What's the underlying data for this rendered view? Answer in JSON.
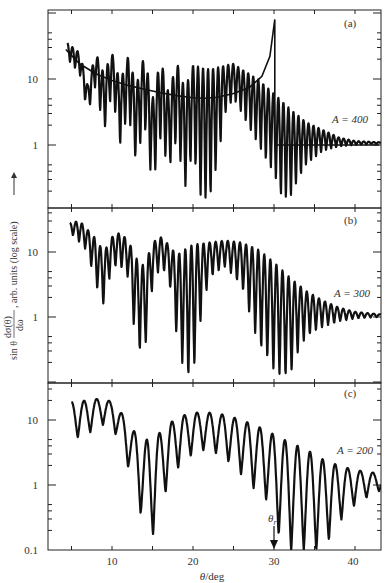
{
  "chart_data": {
    "type": "line",
    "title": "",
    "xlabel": "θ/deg",
    "ylabel": "sin θ dσ(θ)/dω, arb. units (log scale)",
    "xlim": [
      3.5,
      43
    ],
    "x_ticks": [
      5,
      10,
      15,
      20,
      25,
      30,
      35,
      40
    ],
    "x_tick_labels": [
      "10",
      "20",
      "30",
      "40"
    ],
    "y_scale": "log",
    "panels": [
      {
        "id": "a",
        "label": "(a)",
        "series_label": "A = 400",
        "ylim": [
          0.12,
          80
        ],
        "y_tick_labels": [
          "10",
          "1"
        ],
        "oscillation_period_deg": 0.62,
        "envelope_upper": [
          [
            4.5,
            35
          ],
          [
            6,
            25
          ],
          [
            7,
            8
          ],
          [
            8,
            25
          ],
          [
            9,
            12
          ],
          [
            10,
            25
          ],
          [
            11,
            9
          ],
          [
            12,
            22
          ],
          [
            13,
            8
          ],
          [
            14,
            23
          ],
          [
            15,
            5
          ],
          [
            16,
            20
          ],
          [
            17,
            6
          ],
          [
            18,
            18
          ],
          [
            19,
            7
          ],
          [
            20,
            16
          ],
          [
            22,
            14
          ],
          [
            24,
            16
          ],
          [
            25,
            17
          ],
          [
            26,
            14
          ],
          [
            28,
            10
          ],
          [
            30,
            6
          ],
          [
            32,
            3.5
          ],
          [
            34,
            2.2
          ],
          [
            36,
            1.7
          ],
          [
            38,
            1.3
          ],
          [
            40,
            1.15
          ],
          [
            43,
            1.1
          ]
        ],
        "envelope_lower": [
          [
            4.5,
            20
          ],
          [
            6,
            12
          ],
          [
            7,
            3
          ],
          [
            8,
            8
          ],
          [
            9,
            1.5
          ],
          [
            10,
            6
          ],
          [
            11,
            1
          ],
          [
            12,
            3
          ],
          [
            13,
            0.5
          ],
          [
            14,
            2
          ],
          [
            15,
            0.22
          ],
          [
            16,
            1.2
          ],
          [
            17,
            0.4
          ],
          [
            18,
            1.2
          ],
          [
            19,
            0.2
          ],
          [
            20,
            0.8
          ],
          [
            21,
            0.14
          ],
          [
            22,
            0.14
          ],
          [
            23,
            0.5
          ],
          [
            24,
            3
          ],
          [
            25,
            5
          ],
          [
            26,
            3
          ],
          [
            28,
            1
          ],
          [
            30,
            0.35
          ],
          [
            31,
            0.15
          ],
          [
            32,
            0.15
          ],
          [
            33,
            0.3
          ],
          [
            34,
            0.5
          ],
          [
            36,
            0.8
          ],
          [
            38,
            0.95
          ],
          [
            40,
            1.0
          ],
          [
            43,
            1.05
          ]
        ],
        "classical_curve": [
          [
            4.3,
            28
          ],
          [
            6,
            17
          ],
          [
            8,
            12
          ],
          [
            10,
            9.5
          ],
          [
            12,
            8
          ],
          [
            14,
            7
          ],
          [
            16,
            6.2
          ],
          [
            18,
            5.6
          ],
          [
            20,
            5.2
          ],
          [
            21.5,
            5.1
          ],
          [
            23,
            5.3
          ],
          [
            25,
            6
          ],
          [
            27,
            7.5
          ],
          [
            28.5,
            11
          ],
          [
            29.5,
            22
          ],
          [
            30.1,
            80
          ]
        ],
        "classical_after_rainbow": [
          [
            30.1,
            1.0
          ],
          [
            43,
            1.0
          ]
        ]
      },
      {
        "id": "b",
        "label": "(b)",
        "series_label": "A = 300",
        "ylim": [
          0.12,
          60
        ],
        "y_tick_labels": [
          "10",
          "1"
        ],
        "oscillation_period_deg": 0.75,
        "envelope_upper": [
          [
            4.8,
            28
          ],
          [
            6,
            30
          ],
          [
            7,
            22
          ],
          [
            8,
            16
          ],
          [
            9,
            10
          ],
          [
            10,
            17
          ],
          [
            11,
            20
          ],
          [
            12,
            15
          ],
          [
            13,
            8
          ],
          [
            14,
            6
          ],
          [
            15,
            14
          ],
          [
            16,
            17
          ],
          [
            17,
            13
          ],
          [
            18,
            9
          ],
          [
            19,
            11
          ],
          [
            20,
            13
          ],
          [
            22,
            14
          ],
          [
            24,
            15
          ],
          [
            26,
            14
          ],
          [
            28,
            11
          ],
          [
            30,
            7
          ],
          [
            32,
            4
          ],
          [
            34,
            2.5
          ],
          [
            36,
            1.8
          ],
          [
            38,
            1.4
          ],
          [
            40,
            1.2
          ],
          [
            43,
            1.1
          ]
        ],
        "envelope_lower": [
          [
            4.8,
            20
          ],
          [
            6,
            14
          ],
          [
            7,
            10
          ],
          [
            8,
            3
          ],
          [
            9,
            1.5
          ],
          [
            10,
            6
          ],
          [
            11,
            6
          ],
          [
            12,
            4
          ],
          [
            13,
            0.35
          ],
          [
            14,
            0.25
          ],
          [
            15,
            3
          ],
          [
            16,
            6
          ],
          [
            17,
            4
          ],
          [
            18,
            0.5
          ],
          [
            19,
            0.12
          ],
          [
            20,
            0.12
          ],
          [
            21,
            1
          ],
          [
            22,
            4
          ],
          [
            24,
            6
          ],
          [
            26,
            3
          ],
          [
            28,
            0.4
          ],
          [
            30,
            0.15
          ],
          [
            31,
            0.12
          ],
          [
            32,
            0.12
          ],
          [
            33,
            0.3
          ],
          [
            34,
            0.5
          ],
          [
            36,
            0.7
          ],
          [
            38,
            0.85
          ],
          [
            40,
            0.95
          ],
          [
            43,
            1.0
          ]
        ]
      },
      {
        "id": "c",
        "label": "(c)",
        "series_label": "A = 200",
        "ylim": [
          0.1,
          40
        ],
        "y_tick_labels": [
          "10",
          "1",
          "0.1"
        ],
        "oscillation_period_deg": 1.55,
        "envelope_upper": [
          [
            5,
            19
          ],
          [
            7,
            20
          ],
          [
            9,
            22
          ],
          [
            10.5,
            17
          ],
          [
            12,
            9
          ],
          [
            13.5,
            5
          ],
          [
            15,
            5
          ],
          [
            16.5,
            7.5
          ],
          [
            18,
            11
          ],
          [
            20,
            13
          ],
          [
            22,
            13
          ],
          [
            24,
            12
          ],
          [
            26,
            10
          ],
          [
            28,
            8
          ],
          [
            30,
            6
          ],
          [
            32,
            4.5
          ],
          [
            34,
            3.5
          ],
          [
            36,
            2.5
          ],
          [
            38,
            2
          ],
          [
            40,
            1.7
          ],
          [
            43,
            1.5
          ]
        ],
        "envelope_lower": [
          [
            5,
            5
          ],
          [
            7,
            6
          ],
          [
            8.5,
            8.5
          ],
          [
            10,
            8
          ],
          [
            11.5,
            3
          ],
          [
            13,
            0.7
          ],
          [
            14.6,
            0.1
          ],
          [
            16,
            0.5
          ],
          [
            17.5,
            1.4
          ],
          [
            19,
            2.5
          ],
          [
            21,
            3.5
          ],
          [
            23,
            3
          ],
          [
            25,
            2
          ],
          [
            27,
            1
          ],
          [
            29,
            0.6
          ],
          [
            30.5,
            0.18
          ],
          [
            32,
            0.1
          ],
          [
            34,
            0.1
          ],
          [
            36,
            0.1
          ],
          [
            37.5,
            0.2
          ],
          [
            39,
            0.4
          ],
          [
            41,
            0.6
          ],
          [
            43,
            0.8
          ]
        ],
        "annotation": {
          "text": "θr",
          "x": 30,
          "arrow": "down"
        }
      }
    ]
  },
  "labels": {
    "panel_a": "(a)",
    "panel_b": "(b)",
    "panel_c": "(c)",
    "series_a": "A = 400",
    "series_b": "A = 300",
    "series_c": "A = 200",
    "xlabel_theta": "θ",
    "xlabel_unit": "/deg",
    "ylabel_prefix": "sin θ",
    "ylabel_num": "dσ(θ)",
    "ylabel_den": "dω",
    "ylabel_suffix": ", arb. units (log scale)",
    "rainbow_label": "θ",
    "rainbow_sub": "r",
    "x_tick_10": "10",
    "x_tick_20": "20",
    "x_tick_30": "30",
    "x_tick_40": "40",
    "y_a_10": "10",
    "y_a_1": "1",
    "y_b_10": "10",
    "y_b_1": "1",
    "y_c_10": "10",
    "y_c_1": "1",
    "y_c_01": "0.1"
  }
}
